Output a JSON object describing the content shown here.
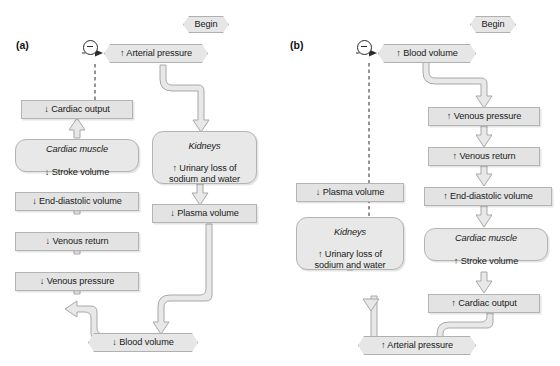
{
  "figure": {
    "background_color": "#ffffff",
    "node_fill": "#e3e3e3",
    "node_border": "#b4b4b4",
    "arrow_fill": "#e8e8e8",
    "arrow_border": "#a8a8a8",
    "dashed_color": "#2b2b2b",
    "text_color": "#1a1a1a"
  },
  "panel_a": {
    "label": "(a)",
    "begin": "Begin",
    "feedback_sign": "−",
    "nodes": {
      "arterial_pressure": "↑ Arterial pressure",
      "cardiac_output": "↓ Cardiac output",
      "cardiac_muscle_organ": "Cardiac muscle",
      "cardiac_muscle_effect": "↓ Stroke volume",
      "end_diastolic_volume": "↓ End-diastolic volume",
      "venous_return": "↓ Venous return",
      "venous_pressure": "↓ Venous pressure",
      "blood_volume": "↓ Blood volume",
      "kidneys_organ": "Kidneys",
      "kidneys_effect": "↑ Urinary loss of\nsodium and water",
      "plasma_volume": "↓ Plasma volume"
    }
  },
  "panel_b": {
    "label": "(b)",
    "begin": "Begin",
    "feedback_sign": "−",
    "nodes": {
      "blood_volume": "↑ Blood volume",
      "venous_pressure": "↑ Venous pressure",
      "venous_return": "↑ Venous return",
      "end_diastolic_volume": "↑ End-diastolic volume",
      "cardiac_muscle_organ": "Cardiac muscle",
      "cardiac_muscle_effect": "↑ Stroke volume",
      "cardiac_output": "↑ Cardiac output",
      "arterial_pressure": "↑ Arterial pressure",
      "plasma_volume": "↓ Plasma volume",
      "kidneys_organ": "Kidneys",
      "kidneys_effect": "↑ Urinary loss of\nsodium and water"
    }
  }
}
